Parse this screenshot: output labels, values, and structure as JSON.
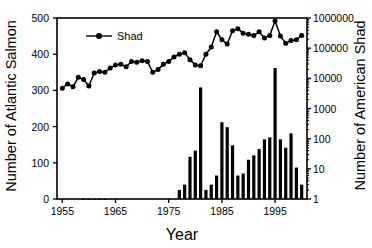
{
  "chart_data": {
    "type": "line",
    "title": "",
    "xlabel": "Year",
    "ylabel_left": "Number of Atlantic Salmon",
    "ylabel_right": "Number of American Shad",
    "xlim": [
      1954,
      2001
    ],
    "ylim_left": [
      0,
      500
    ],
    "ylim_right": [
      1,
      1000000
    ],
    "yscale_right": "log",
    "grid": false,
    "legend": {
      "position": "top-left-inside",
      "entries": [
        "Shad"
      ]
    },
    "xticks": [
      "1955",
      "1965",
      "1975",
      "1985",
      "1995"
    ],
    "xtick_values": [
      1955,
      1965,
      1975,
      1985,
      1995
    ],
    "yticks_left": [
      "0",
      "100",
      "200",
      "300",
      "400",
      "500"
    ],
    "ytick_values_left": [
      0,
      100,
      200,
      300,
      400,
      500
    ],
    "yticks_right": [
      "1",
      "10",
      "100",
      "1000",
      "10000",
      "100000",
      "1000000"
    ],
    "ytick_values_right": [
      1,
      10,
      100,
      1000,
      10000,
      100000,
      1000000
    ],
    "series": [
      {
        "name": "Atlantic Salmon",
        "render": "line-markers",
        "axis": "left",
        "color": "#000000",
        "x": [
          1955,
          1956,
          1957,
          1958,
          1959,
          1960,
          1961,
          1962,
          1963,
          1964,
          1965,
          1966,
          1967,
          1968,
          1969,
          1970,
          1971,
          1972,
          1973,
          1974,
          1975,
          1976,
          1977,
          1978,
          1979,
          1980,
          1981,
          1982,
          1983,
          1984,
          1985,
          1986,
          1987,
          1988,
          1989,
          1990,
          1991,
          1992,
          1993,
          1994,
          1995,
          1996,
          1997,
          1998,
          1999,
          2000
        ],
        "values": [
          306,
          318,
          310,
          336,
          330,
          312,
          348,
          352,
          350,
          362,
          370,
          372,
          365,
          380,
          378,
          382,
          380,
          350,
          358,
          372,
          380,
          392,
          400,
          404,
          385,
          370,
          368,
          400,
          420,
          462,
          440,
          428,
          465,
          470,
          458,
          455,
          452,
          462,
          445,
          452,
          492,
          450,
          430,
          438,
          440,
          452
        ]
      },
      {
        "name": "American Shad",
        "render": "bars",
        "axis": "right",
        "color": "#000000",
        "x": [
          1955,
          1956,
          1957,
          1958,
          1959,
          1960,
          1961,
          1962,
          1963,
          1964,
          1965,
          1966,
          1967,
          1968,
          1969,
          1970,
          1971,
          1972,
          1973,
          1974,
          1975,
          1976,
          1977,
          1978,
          1979,
          1980,
          1981,
          1982,
          1983,
          1984,
          1985,
          1986,
          1987,
          1988,
          1989,
          1990,
          1991,
          1992,
          1993,
          1994,
          1995,
          1996,
          1997,
          1998,
          1999,
          2000
        ],
        "values": [
          0,
          0,
          0,
          0,
          1,
          1,
          1,
          1,
          1,
          0,
          0,
          0,
          0,
          0,
          0,
          0,
          0,
          0,
          0,
          0,
          0,
          0,
          2,
          3,
          25,
          40,
          5000,
          2,
          3,
          6,
          350,
          240,
          60,
          6,
          7,
          20,
          28,
          45,
          95,
          110,
          22000,
          95,
          50,
          150,
          11,
          3
        ]
      }
    ]
  },
  "legend": {
    "shad_label": "Shad"
  }
}
